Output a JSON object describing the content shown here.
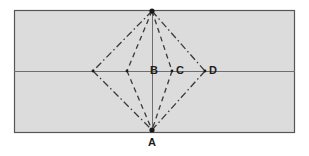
{
  "figure": {
    "canvas": {
      "width": 309,
      "height": 156,
      "background": "#ffffff"
    },
    "colors": {
      "panel_fill": "#dcdcdc",
      "panel_border": "#575757",
      "axis_line": "#6e6e6e",
      "construction_line": "#3a3a3a",
      "vertex_marker": "#1a1a1a",
      "label_text": "#1c1c1c"
    },
    "panel": {
      "x": 14,
      "y": 10,
      "width": 281,
      "height": 123
    },
    "axes": {
      "horizontal": {
        "y": 71,
        "x1": 14,
        "x2": 295
      },
      "vertical": {
        "x": 152,
        "y1": 11,
        "y2": 130
      }
    },
    "vertices": [
      {
        "name": "apex-top",
        "x": 152,
        "y": 11,
        "marker": true,
        "label": ""
      },
      {
        "name": "apex-bottom",
        "x": 152,
        "y": 130,
        "marker": true,
        "label": "A"
      },
      {
        "name": "point-b",
        "x": 152,
        "y": 71,
        "marker": false,
        "label": "B"
      },
      {
        "name": "point-c",
        "x": 172,
        "y": 71,
        "marker": true,
        "label": "C"
      },
      {
        "name": "point-d",
        "x": 205,
        "y": 71,
        "marker": true,
        "label": "D"
      },
      {
        "name": "point-left-inner",
        "x": 127,
        "y": 71,
        "marker": true,
        "label": ""
      },
      {
        "name": "point-left-outer",
        "x": 93,
        "y": 71,
        "marker": true,
        "label": ""
      }
    ],
    "labels": [
      {
        "id": "label-b",
        "text": "B",
        "x": 150,
        "y": 74
      },
      {
        "id": "label-c",
        "text": "C",
        "x": 176,
        "y": 74
      },
      {
        "id": "label-d",
        "text": "D",
        "x": 209,
        "y": 74
      },
      {
        "id": "label-a",
        "text": "A",
        "x": 148,
        "y": 146
      }
    ],
    "rhombi": [
      {
        "id": "rhombus-outer",
        "style": "dash-dot",
        "left_x": 93,
        "right_x": 205
      },
      {
        "id": "rhombus-inner",
        "style": "dashed",
        "left_x": 127,
        "right_x": 172
      }
    ],
    "stroke_patterns": {
      "dash_dot": "7 3 1.5 3",
      "dashed": "5 4"
    }
  }
}
